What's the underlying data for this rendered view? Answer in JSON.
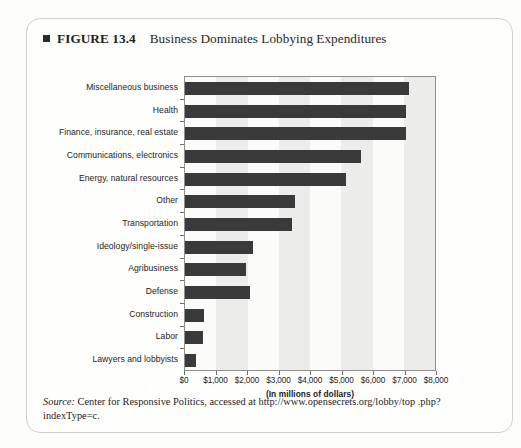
{
  "figure": {
    "label": "FIGURE 13.4",
    "title": "Business Dominates Lobbying Expenditures",
    "marker_icon": "filled-square-icon"
  },
  "source_note": {
    "prefix": "Source:",
    "text": " Center for Responsive Politics, accessed at http://www.opensecrets.org/lobby/top .php?indexType=c."
  },
  "chart_data": {
    "type": "bar",
    "orientation": "horizontal",
    "title": "Business Dominates Lobbying Expenditures",
    "xlabel": "(In millions of dollars)",
    "ylabel": "",
    "xlim": [
      0,
      8000
    ],
    "xticks": [
      0,
      1000,
      2000,
      3000,
      4000,
      5000,
      6000,
      7000,
      8000
    ],
    "xtick_labels": [
      "$0",
      "$1,000",
      "$2,000",
      "$3,000",
      "$4,000",
      "$5,000",
      "$6,000",
      "$7,000",
      "$8,000"
    ],
    "grid": "alternating-vertical-bands",
    "legend": "none",
    "bar_color": "#3a3a3a",
    "categories": [
      "Miscellaneous business",
      "Health",
      "Finance, insurance, real estate",
      "Communications, electronics",
      "Energy, natural resources",
      "Other",
      "Transportation",
      "Ideology/single-issue",
      "Agribusiness",
      "Defense",
      "Construction",
      "Labor",
      "Lawyers and lobbyists"
    ],
    "values": [
      7100,
      7000,
      7000,
      5600,
      5100,
      3500,
      3400,
      2150,
      1950,
      2050,
      600,
      560,
      350
    ]
  }
}
